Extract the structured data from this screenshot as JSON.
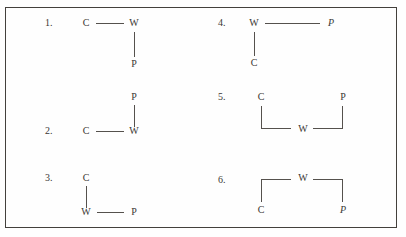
{
  "figure": {
    "title": "",
    "frame": {
      "border_color": "#43403c",
      "background": "#fefefe"
    },
    "line_color": "#55514d",
    "text_color": "#3a3734",
    "node_labels": {
      "c": "C",
      "w": "W",
      "p": "P"
    },
    "items": [
      {
        "number": "1.",
        "column": "left",
        "nodes": [
          {
            "label": "C",
            "role": "c"
          },
          {
            "label": "W",
            "role": "w"
          },
          {
            "label": "P",
            "role": "p"
          }
        ],
        "edges": [
          {
            "from": "C",
            "to": "W",
            "orientation": "horizontal"
          },
          {
            "from": "W",
            "to": "P",
            "orientation": "vertical"
          }
        ],
        "description": "C linked right to W; W linked down to P"
      },
      {
        "number": "2.",
        "column": "left",
        "nodes": [
          {
            "label": "P",
            "role": "p"
          },
          {
            "label": "C",
            "role": "c"
          },
          {
            "label": "W",
            "role": "w"
          }
        ],
        "edges": [
          {
            "from": "P",
            "to": "W",
            "orientation": "vertical"
          },
          {
            "from": "C",
            "to": "W",
            "orientation": "horizontal"
          }
        ],
        "description": "P above W; C linked right to W"
      },
      {
        "number": "3.",
        "column": "left",
        "nodes": [
          {
            "label": "C",
            "role": "c"
          },
          {
            "label": "W",
            "role": "w"
          },
          {
            "label": "P",
            "role": "p"
          }
        ],
        "edges": [
          {
            "from": "C",
            "to": "W",
            "orientation": "vertical"
          },
          {
            "from": "W",
            "to": "P",
            "orientation": "horizontal"
          }
        ],
        "description": "C above W; W linked right to P"
      },
      {
        "number": "4.",
        "column": "right",
        "nodes": [
          {
            "label": "W",
            "role": "w"
          },
          {
            "label": "P",
            "role": "p"
          },
          {
            "label": "C",
            "role": "c"
          }
        ],
        "edges": [
          {
            "from": "W",
            "to": "P",
            "orientation": "horizontal"
          },
          {
            "from": "W",
            "to": "C",
            "orientation": "vertical"
          }
        ],
        "description": "W linked right to P; W linked down to C"
      },
      {
        "number": "5.",
        "column": "right",
        "nodes": [
          {
            "label": "C",
            "role": "c"
          },
          {
            "label": "P",
            "role": "p"
          },
          {
            "label": "W",
            "role": "w"
          }
        ],
        "edges": [
          {
            "from": "C",
            "to": "W",
            "orientation": "bracket-down-right"
          },
          {
            "from": "P",
            "to": "W",
            "orientation": "bracket-down-left"
          }
        ],
        "description": "C top-left and P top-right both bracket down to W at bottom centre"
      },
      {
        "number": "6.",
        "column": "right",
        "nodes": [
          {
            "label": "W",
            "role": "w"
          },
          {
            "label": "C",
            "role": "c"
          },
          {
            "label": "P",
            "role": "p"
          }
        ],
        "edges": [
          {
            "from": "W",
            "to": "C",
            "orientation": "bracket-up-left"
          },
          {
            "from": "W",
            "to": "P",
            "orientation": "bracket-up-right"
          }
        ],
        "description": "W at top centre brackets down-left to C and down-right to P"
      }
    ]
  }
}
